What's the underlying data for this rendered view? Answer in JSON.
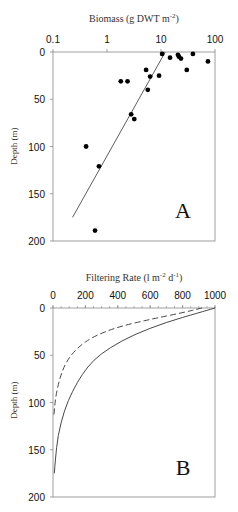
{
  "chart_data": [
    {
      "panel": "A",
      "type": "scatter",
      "title": "Biomass (g DWT m-2)",
      "xlabel": "Biomass (g DWT m-2)",
      "ylabel": "Depth (m)",
      "xscale": "log",
      "xlim": [
        0.1,
        100
      ],
      "ylim": [
        0,
        200
      ],
      "y_inverted": true,
      "x_ticks": [
        "0.1",
        "1",
        "10",
        "100"
      ],
      "y_ticks": [
        "0",
        "50",
        "100",
        "150",
        "200"
      ],
      "points": [
        {
          "x": 10.5,
          "y": 2
        },
        {
          "x": 14.7,
          "y": 6
        },
        {
          "x": 20.6,
          "y": 3
        },
        {
          "x": 21.5,
          "y": 5
        },
        {
          "x": 23.4,
          "y": 7
        },
        {
          "x": 39,
          "y": 2
        },
        {
          "x": 74,
          "y": 10
        },
        {
          "x": 30,
          "y": 19
        },
        {
          "x": 5.3,
          "y": 19
        },
        {
          "x": 6.3,
          "y": 26
        },
        {
          "x": 9.2,
          "y": 25
        },
        {
          "x": 1.8,
          "y": 31
        },
        {
          "x": 2.4,
          "y": 31
        },
        {
          "x": 5.7,
          "y": 40
        },
        {
          "x": 2.8,
          "y": 66
        },
        {
          "x": 3.2,
          "y": 71
        },
        {
          "x": 0.41,
          "y": 100
        },
        {
          "x": 0.71,
          "y": 121
        },
        {
          "x": 0.6,
          "y": 189
        }
      ],
      "fit_line": {
        "x": [
          0.23,
          12
        ],
        "y": [
          175,
          0
        ]
      },
      "panel_label": "A"
    },
    {
      "panel": "B",
      "type": "line",
      "title": "Filtering Rate (l m-2 d-1)",
      "xlabel": "Filtering Rate (l m-2 d-1)",
      "ylabel": "Depth (m)",
      "xlim": [
        0,
        1000
      ],
      "ylim": [
        0,
        200
      ],
      "y_inverted": true,
      "x_ticks": [
        "0",
        "200",
        "400",
        "600",
        "800",
        "1000"
      ],
      "y_ticks": [
        "0",
        "50",
        "100",
        "150",
        "200"
      ],
      "series": [
        {
          "name": "solid",
          "style": "solid",
          "x": [
            1000,
            900,
            700,
            500,
            350,
            250,
            180,
            120,
            70,
            30,
            15,
            8
          ],
          "y": [
            0,
            5,
            15,
            28,
            42,
            55,
            70,
            88,
            108,
            135,
            160,
            175
          ]
        },
        {
          "name": "dashed",
          "style": "dashed",
          "x": [
            920,
            800,
            600,
            400,
            250,
            150,
            80,
            40,
            15,
            5
          ],
          "y": [
            0,
            5,
            12,
            20,
            30,
            42,
            57,
            75,
            95,
            115
          ]
        }
      ],
      "panel_label": "B"
    }
  ],
  "labels": {
    "a_title": "Biomass (g DWT m",
    "a_title_sup": "-2",
    "a_title_end": ")",
    "b_title": "Filtering Rate (l m",
    "b_title_sup1": "-2",
    "b_title_mid": " d",
    "b_title_sup2": "-1",
    "b_title_end": ")",
    "ylabel": "Depth (m)",
    "panel_a": "A",
    "panel_b": "B"
  }
}
